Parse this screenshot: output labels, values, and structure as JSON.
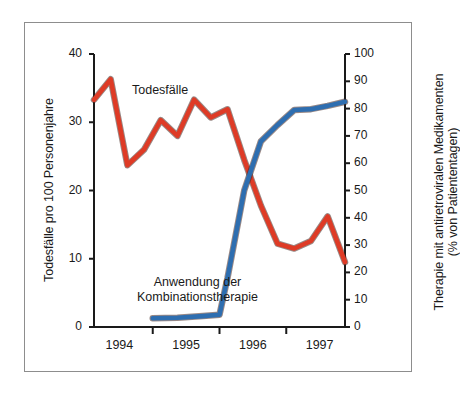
{
  "chart_data": {
    "type": "line",
    "title": "",
    "subtitle": "",
    "xlabel": "",
    "grid": false,
    "legend_position": "inline-annotations",
    "x_axis": {
      "tick_labels": [
        "1994",
        "1995",
        "1996",
        "1997"
      ],
      "tick_values": [
        1994,
        1995,
        1996,
        1997
      ],
      "range": [
        1993.62,
        1997.38
      ],
      "note": "quarterly observations; year labels centered on each year"
    },
    "y_axis_left": {
      "label": "Todesfälle pro 100 Personenjahre",
      "tick_labels": [
        "0",
        "10",
        "20",
        "30",
        "40"
      ],
      "tick_values": [
        0,
        10,
        20,
        30,
        40
      ],
      "range": [
        0,
        40
      ]
    },
    "y_axis_right": {
      "label": "Therapie mit antiretroviralen Medikamenten",
      "label_line2": "(% von Patiententagen)",
      "tick_labels": [
        "0",
        "10",
        "20",
        "30",
        "40",
        "50",
        "60",
        "70",
        "80",
        "90",
        "100"
      ],
      "tick_values": [
        0,
        10,
        20,
        30,
        40,
        50,
        60,
        70,
        80,
        90,
        100
      ],
      "range": [
        0,
        100
      ]
    },
    "series": [
      {
        "name": "Todesfälle",
        "axis": "left",
        "color": "#DE3B26",
        "x": [
          1993.62,
          1993.87,
          1994.12,
          1994.37,
          1994.62,
          1994.87,
          1995.12,
          1995.37,
          1995.62,
          1995.87,
          1996.12,
          1996.37,
          1996.62,
          1996.87,
          1997.12,
          1997.38
        ],
        "values": [
          33.3,
          36.3,
          23.7,
          26.0,
          30.3,
          28.0,
          33.3,
          30.7,
          31.9,
          24.5,
          17.8,
          12.2,
          11.5,
          12.6,
          16.2,
          9.5
        ]
      },
      {
        "name": "Anwendung der Kombinationstherapie",
        "axis": "right",
        "color": "#2E6EB0",
        "x": [
          1994.5,
          1994.87,
          1995.25,
          1995.5,
          1995.62,
          1995.87,
          1996.12,
          1996.37,
          1996.62,
          1996.87,
          1997.12,
          1997.38
        ],
        "values": [
          3.2,
          3.4,
          4.0,
          4.5,
          18.0,
          50.0,
          68.0,
          74.0,
          79.5,
          79.8,
          81.0,
          82.5
        ]
      }
    ],
    "annotations": [
      {
        "text": "Todesfälle",
        "series": "Todesfälle",
        "color": "#1a1a1a"
      },
      {
        "text": "Anwendung der",
        "text_line2": "Kombinationstherapie",
        "series": "Anwendung der Kombinationstherapie",
        "color": "#1a1a1a"
      }
    ],
    "colors": {
      "deaths_red": "#DE3B26",
      "therapy_blue": "#2E6EB0",
      "axis_black": "#1a1a1a",
      "frame_gray": "#8d8d8d",
      "background": "#ffffff"
    }
  }
}
